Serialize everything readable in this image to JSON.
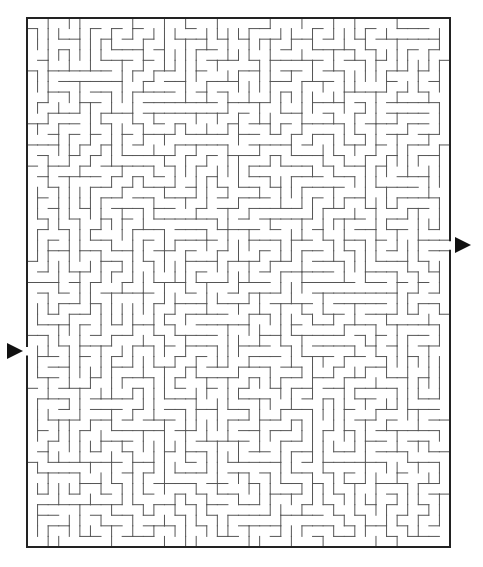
{
  "puzzle": {
    "type": "maze",
    "grid": {
      "cols": 40,
      "rows": 50
    },
    "frame": {
      "x": 27,
      "y": 18,
      "width": 423,
      "height": 529
    },
    "colors": {
      "border": "#222222",
      "wall": "#555555",
      "arrow": "#111111",
      "background": "#ffffff"
    },
    "entrance": {
      "side": "left",
      "row": 31,
      "arrow": "right-pointing-triangle",
      "arrow_center": [
        15,
        351
      ]
    },
    "exit": {
      "side": "right",
      "row": 21,
      "arrow": "right-pointing-triangle",
      "arrow_center": [
        463,
        245
      ]
    },
    "seed": 48367
  }
}
